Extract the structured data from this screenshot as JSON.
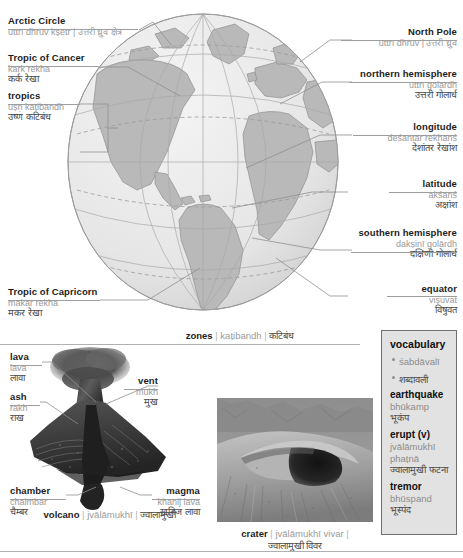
{
  "globe": {
    "caption": {
      "en": "zones",
      "rom": "kaṭibandh",
      "dev": "कटिबंध"
    },
    "labels_left": [
      {
        "en": "Arctic Circle",
        "rom": "uttrī dhruv kṣetr | उत्तरी ध्रुव क्षेत्र",
        "dev": "",
        "inline": true
      },
      {
        "en": "Tropic of Cancer",
        "rom": "kark rekhā",
        "dev": "कर्क रेखा"
      },
      {
        "en": "tropics",
        "rom": "uṣṇ kaṭibandh",
        "dev": "उष्ण कटिबंध"
      },
      {
        "en": "Tropic of Capricorn",
        "rom": "makar rekhā",
        "dev": "मकर रेखा"
      }
    ],
    "labels_right": [
      {
        "en": "North Pole",
        "rom": "uttrī dhruv | उत्तरी ध्रुव",
        "dev": "",
        "inline": true
      },
      {
        "en": "northern hemisphere",
        "rom": "uttrī golārdh",
        "dev": "उत्तरी गोलार्ध"
      },
      {
        "en": "longitude",
        "rom": "deśāntar rekhānś",
        "dev": "देशांतर रेखांश"
      },
      {
        "en": "latitude",
        "rom": "akśānś",
        "dev": "अक्षांश"
      },
      {
        "en": "southern hemisphere",
        "rom": "dakṣiṇī golārdh",
        "dev": "दक्षिणी गोलार्ध"
      },
      {
        "en": "equator",
        "rom": "viṣuvat",
        "dev": "विषुवत"
      }
    ]
  },
  "volcano": {
    "caption": {
      "en": "volcano",
      "rom": "jvālāmukhī",
      "dev": "ज्वालामुखी"
    },
    "labels": [
      {
        "en": "lava",
        "rom": "lāvā",
        "dev": "लावा"
      },
      {
        "en": "ash",
        "rom": "rākh",
        "dev": "राख"
      },
      {
        "en": "vent",
        "rom": "mukh",
        "dev": "मुख"
      },
      {
        "en": "chamber",
        "rom": "chaimbar",
        "dev": "चैम्बर"
      },
      {
        "en": "magma",
        "rom": "khanij lāvā",
        "dev": "खनिज लावा"
      }
    ]
  },
  "crater": {
    "caption": {
      "en": "crater",
      "rom": "jvālāmukhī vivar",
      "dev": "ज्वालामुखी विवर"
    }
  },
  "vocabulary": {
    "title": "vocabulary",
    "title_rom": "śabdāvalī",
    "title_dev": "शब्दावली",
    "entries": [
      {
        "term": "earthquake",
        "rom": [
          "bhūkamp"
        ],
        "dev": "भूकंप"
      },
      {
        "term": "erupt (v)",
        "rom": [
          "jvālāmukhī",
          "phaṭnā"
        ],
        "dev": "ज्वालामुखी फटना"
      },
      {
        "term": "tremor",
        "rom": [
          "bhūspand"
        ],
        "dev": "भूस्पंद"
      }
    ]
  },
  "colors": {
    "ink": "#1d1d1d",
    "roman": "#9a9a9a",
    "devanagari": "#4a4a4a",
    "rule": "#9e9e9e",
    "vocab_fill": "#e2e2e2",
    "vocab_border": "#6f6f6f",
    "land": "#b9b9b9",
    "ocean": "#e8e8e8"
  }
}
